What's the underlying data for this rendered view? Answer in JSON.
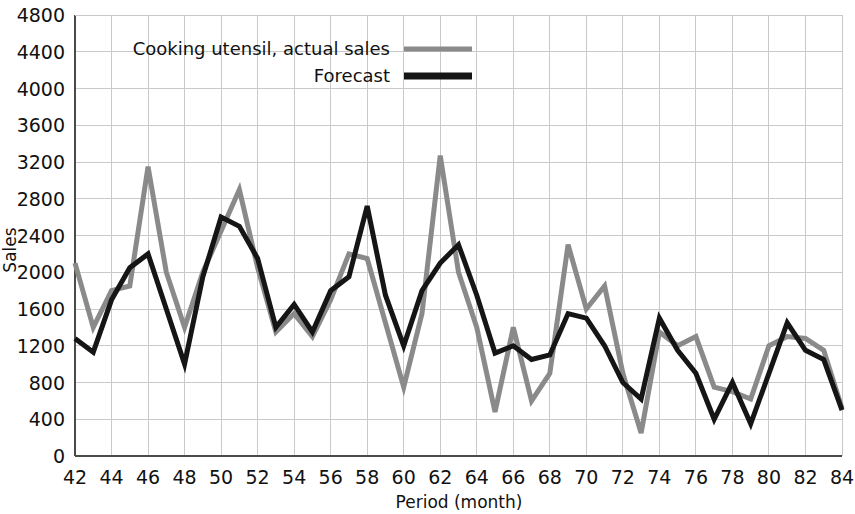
{
  "chart_data": {
    "type": "line",
    "title": "",
    "xlabel": "Period (month)",
    "ylabel": "Sales",
    "xlim": [
      42,
      84
    ],
    "ylim": [
      0,
      4800
    ],
    "xticks": [
      42,
      44,
      46,
      48,
      50,
      52,
      54,
      56,
      58,
      60,
      62,
      64,
      66,
      68,
      70,
      72,
      74,
      76,
      78,
      80,
      82,
      84
    ],
    "yticks": [
      0,
      400,
      800,
      1200,
      1600,
      2000,
      2400,
      2800,
      3200,
      3600,
      4000,
      4400,
      4800
    ],
    "grid": true,
    "legend_position": "top-left",
    "x": [
      42,
      43,
      44,
      45,
      46,
      47,
      48,
      49,
      50,
      51,
      52,
      53,
      54,
      55,
      56,
      57,
      58,
      59,
      60,
      61,
      62,
      63,
      64,
      65,
      66,
      67,
      68,
      69,
      70,
      71,
      72,
      73,
      74,
      75,
      76,
      77,
      78,
      79,
      80,
      81,
      82,
      83,
      84
    ],
    "series": [
      {
        "name": "Cooking utensil, actual sales",
        "color": "#8a8a8a",
        "width": 5,
        "values": [
          2100,
          1400,
          1800,
          1850,
          3150,
          2000,
          1400,
          2000,
          2450,
          2900,
          2050,
          1350,
          1550,
          1300,
          1700,
          2200,
          2150,
          1450,
          750,
          1550,
          3270,
          2000,
          1400,
          480,
          1400,
          600,
          900,
          2300,
          1600,
          1850,
          900,
          250,
          1350,
          1200,
          1300,
          750,
          700,
          620,
          1200,
          1300,
          1280,
          1150,
          520
        ]
      },
      {
        "name": "Forecast",
        "color": "#151515",
        "width": 5,
        "values": [
          1280,
          1130,
          1700,
          2050,
          2200,
          1600,
          1000,
          1950,
          2600,
          2500,
          2150,
          1400,
          1650,
          1350,
          1800,
          1950,
          2720,
          1750,
          1200,
          1800,
          2100,
          2300,
          1750,
          1120,
          1200,
          1050,
          1100,
          1550,
          1500,
          1200,
          800,
          620,
          1500,
          1150,
          900,
          400,
          800,
          350,
          900,
          1450,
          1150,
          1050,
          500
        ]
      }
    ]
  },
  "legend": {
    "entries": [
      {
        "label": "Cooking utensil, actual sales",
        "color": "#8a8a8a",
        "thickness": 5
      },
      {
        "label": "Forecast",
        "color": "#151515",
        "thickness": 7
      }
    ]
  },
  "axes": {
    "y_title": "Sales",
    "x_title": "Period (month)"
  }
}
